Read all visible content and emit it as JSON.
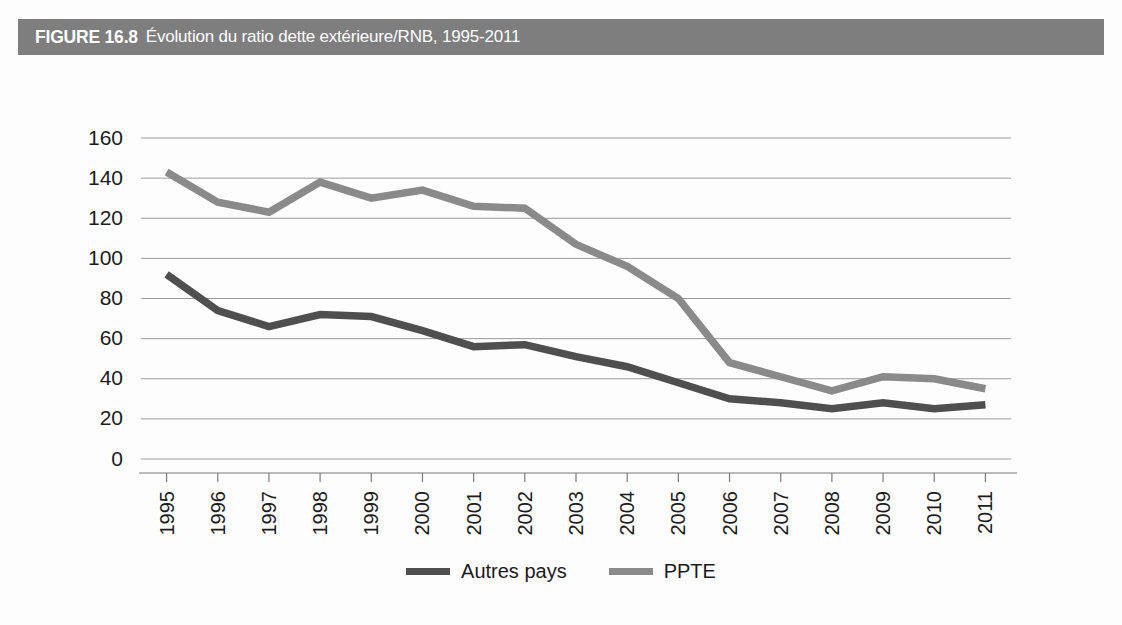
{
  "figure": {
    "number_label": "FIGURE 16.8",
    "title": "Évolution du ratio dette extérieure/RNB, 1995-2011",
    "band_color": "#7e7e7e"
  },
  "legend": {
    "items": [
      {
        "label": "Autres pays",
        "color": "#4f4f4f"
      },
      {
        "label": "PPTE",
        "color": "#8a8a8a"
      }
    ]
  },
  "chart_data": {
    "type": "line",
    "title": "Évolution du ratio dette extérieure/RNB, 1995-2011",
    "xlabel": "",
    "ylabel": "",
    "categories": [
      "1995",
      "1996",
      "1997",
      "1998",
      "1999",
      "2000",
      "2001",
      "2002",
      "2003",
      "2004",
      "2005",
      "2006",
      "2007",
      "2008",
      "2009",
      "2010",
      "2011"
    ],
    "yticks": [
      0,
      20,
      40,
      60,
      80,
      100,
      120,
      140,
      160
    ],
    "ylim": [
      0,
      160
    ],
    "grid": true,
    "legend_position": "bottom-center",
    "series": [
      {
        "name": "Autres pays",
        "color": "#4f4f4f",
        "values": [
          92,
          74,
          66,
          72,
          71,
          64,
          56,
          57,
          51,
          46,
          38,
          30,
          28,
          25,
          28,
          25,
          27
        ]
      },
      {
        "name": "PPTE",
        "color": "#8a8a8a",
        "values": [
          143,
          128,
          123,
          138,
          130,
          134,
          126,
          125,
          107,
          96,
          80,
          48,
          41,
          34,
          41,
          40,
          35
        ]
      }
    ]
  }
}
